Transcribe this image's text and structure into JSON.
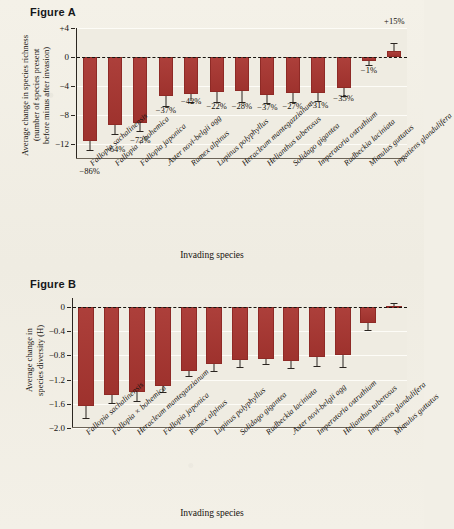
{
  "figureA": {
    "title": "Figure A",
    "ytitle": "Average change in species richness\n(number of species present\nbefore minus after invasion)",
    "xtitle": "Invading species",
    "yticks": [
      "+4",
      "0",
      "−4",
      "−8",
      "−12"
    ]
  },
  "figureB": {
    "title": "Figure B",
    "ytitle": "Average change in\nspecies diversity (H)",
    "xtitle": "Invading species",
    "yticks": [
      "0",
      "−0.4",
      "−0.8",
      "−1.2",
      "−1.6",
      "−2.0"
    ]
  },
  "chart_data": [
    {
      "type": "bar",
      "id": "figure-a",
      "title": "Figure A",
      "xlabel": "Invading species",
      "ylabel": "Average change in species richness (number of species present before minus after invasion)",
      "ylim": [
        -14,
        4
      ],
      "yticks": [
        4,
        0,
        -4,
        -8,
        -12
      ],
      "grid": true,
      "zero_reference_line": true,
      "error_bars": true,
      "categories": [
        "Fallopia sachalinensis",
        "Fallopia × bohemica",
        "Fallopia japonica",
        "Aster novi-belgii agg.",
        "Rumex alpinus",
        "Lupinus polyphyllus",
        "Heracleum mantegazzianum",
        "Helianthus tuberosus",
        "Solidago gigantea",
        "Imperatoria ostruthium",
        "Rudbeckia laciniata",
        "Mimulus guttatus",
        "Impatiens glandulifera"
      ],
      "values": [
        -11.5,
        -9.3,
        -9.0,
        -5.4,
        -5.1,
        -4.8,
        -4.7,
        -5.2,
        -4.9,
        -4.9,
        -4.2,
        -0.5,
        0.9
      ],
      "errors": [
        1.3,
        1.2,
        1.1,
        1.3,
        1.0,
        1.4,
        1.4,
        1.1,
        1.3,
        1.1,
        1.2,
        0.6,
        1.0
      ],
      "data_labels": [
        "−86%",
        "−64%",
        "−73%",
        "−37%",
        "−42%",
        "−22%",
        "−28%",
        "−37%",
        "−27%",
        "−31%",
        "−35%",
        "−1%",
        "+15%"
      ]
    },
    {
      "type": "bar",
      "id": "figure-b",
      "title": "Figure B",
      "xlabel": "Invading species",
      "ylabel": "Average change in species diversity (H)",
      "ylim": [
        -2.0,
        0.15
      ],
      "yticks": [
        0,
        -0.4,
        -0.8,
        -1.2,
        -1.6,
        -2.0
      ],
      "grid": true,
      "zero_reference_line": true,
      "error_bars": true,
      "categories": [
        "Fallopia sachalinensis",
        "Fallopia × bohemica",
        "Heracleum mantegazzianum",
        "Fallopia japonica",
        "Rumex alpinus",
        "Lupinus polyphyllus",
        "Solidago gigantea",
        "Rudbeckia laciniata",
        "Aster novi-belgii agg.",
        "Imperatoria ostruthium",
        "Helianthus tuberosus",
        "Impatiens glandulifera",
        "Mimulus guttatus"
      ],
      "values": [
        -1.64,
        -1.45,
        -1.4,
        -1.3,
        -1.06,
        -0.94,
        -0.87,
        -0.86,
        -0.9,
        -0.82,
        -0.8,
        -0.27,
        0.02
      ],
      "errors": [
        0.19,
        0.14,
        0.15,
        0.1,
        0.08,
        0.12,
        0.12,
        0.08,
        0.1,
        0.16,
        0.19,
        0.11,
        0.05
      ]
    }
  ]
}
